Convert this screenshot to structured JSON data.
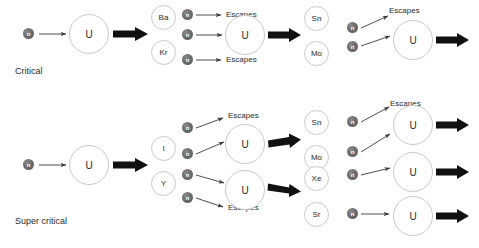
{
  "diagram": {
    "title_visible": false,
    "background_color": "#ffffff",
    "neutron_color": "#6e6e6e",
    "nucleus_outline_color": "#c9c9c9",
    "text_color": "#2b2b2b",
    "thick_arrow_color": "#111111",
    "thin_arrow_color": "#3a3a3a"
  },
  "captions": {
    "critical": "Critical",
    "super_critical": "Super critical"
  },
  "labels": {
    "neutron": "n",
    "uranium": "U",
    "escapes": "Escapes"
  },
  "products": {
    "ba": "Ba",
    "kr": "Kr",
    "sn": "Sn",
    "mo": "Mo",
    "i": "I",
    "y": "Y",
    "xe": "Xe",
    "sr": "Sr"
  },
  "rows": [
    {
      "name": "critical",
      "caption": "Critical",
      "generations": [
        {
          "index": 1,
          "incoming_neutrons": 1,
          "nuclei": 1,
          "products": [
            "Ba",
            "Kr"
          ],
          "escapes": 0
        },
        {
          "index": 2,
          "incoming_neutrons": 3,
          "nuclei": 1,
          "products": [
            "Sn",
            "Mo"
          ],
          "escapes": 2
        },
        {
          "index": 3,
          "incoming_neutrons": 2,
          "nuclei": 1,
          "products": [],
          "escapes": 1
        }
      ]
    },
    {
      "name": "super_critical",
      "caption": "Super critical",
      "generations": [
        {
          "index": 1,
          "incoming_neutrons": 1,
          "nuclei": 1,
          "products": [
            "I",
            "Y"
          ],
          "escapes": 0
        },
        {
          "index": 2,
          "incoming_neutrons": 4,
          "nuclei": 2,
          "products": [
            "Sn",
            "Mo",
            "Xe",
            "Sr"
          ],
          "escapes": 2
        },
        {
          "index": 3,
          "incoming_neutrons": 4,
          "nuclei": 3,
          "products": [],
          "escapes": 1
        }
      ]
    }
  ]
}
